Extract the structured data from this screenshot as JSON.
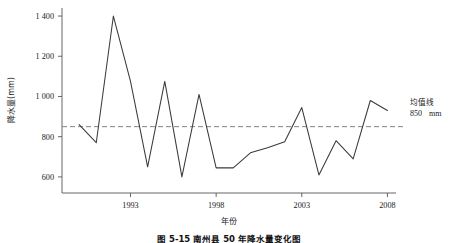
{
  "chart_data": {
    "type": "line",
    "title": "",
    "xlabel": "年份",
    "ylabel": "降水量(mm)",
    "xlim": [
      1989,
      2008.5
    ],
    "ylim": [
      520,
      1440
    ],
    "xticks": [
      1993,
      1998,
      2003,
      2008
    ],
    "xtick_labels": [
      "1993",
      "1998",
      "2003",
      "2008"
    ],
    "yticks": [
      600,
      800,
      1000,
      1200,
      1400
    ],
    "ytick_labels": [
      "600",
      "800",
      "1 000",
      "1 200",
      "1 400"
    ],
    "grid": false,
    "legend_position": "right",
    "series": [
      {
        "name": "年降水量",
        "x": [
          1990,
          1991,
          1992,
          1993,
          1994,
          1995,
          1996,
          1997,
          1998,
          1999,
          2000,
          2001,
          2002,
          2003,
          2004,
          2005,
          2006,
          2007,
          2008
        ],
        "values": [
          860,
          770,
          1400,
          1075,
          650,
          1075,
          600,
          1010,
          645,
          645,
          720,
          745,
          775,
          945,
          610,
          780,
          690,
          980,
          930
        ]
      }
    ],
    "reference_line": {
      "name": "均值线",
      "value": 850,
      "style": "dashed",
      "label_line1": "均值线",
      "label_line2": "850",
      "label_unit": "mm"
    },
    "series_color": "#3a3a3a",
    "reference_color": "#777777",
    "axis_color": "#555555",
    "caption": "图 5-15  南州县 50 年降水量变化图"
  },
  "annotations": {
    "mean_label": "均值线",
    "mean_value": "850",
    "mean_unit": "mm"
  }
}
